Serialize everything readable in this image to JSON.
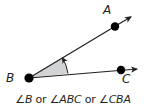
{
  "diagram": {
    "type": "angle",
    "vertex": {
      "label": "B",
      "x": 29,
      "y": 78
    },
    "points": [
      {
        "label": "A",
        "x": 115,
        "y": 26
      },
      {
        "label": "C",
        "x": 121,
        "y": 70
      }
    ],
    "rays": [
      {
        "from": "B",
        "through": "A",
        "arrow_tip": {
          "x": 132,
          "y": 16
        }
      },
      {
        "from": "B",
        "through": "C",
        "arrow_tip": {
          "x": 138,
          "y": 69
        }
      }
    ],
    "shaded_sector_color": "#d1d3d4",
    "line_color": "#231f20"
  },
  "labels": {
    "A": "A",
    "B": "B",
    "C": "C"
  },
  "caption": {
    "part1_symbol": "∠",
    "part1": "B",
    "or1": " or ",
    "part2_symbol": "∠",
    "part2": "ABC",
    "or2": " or ",
    "part3_symbol": "∠",
    "part3": "CBA"
  }
}
